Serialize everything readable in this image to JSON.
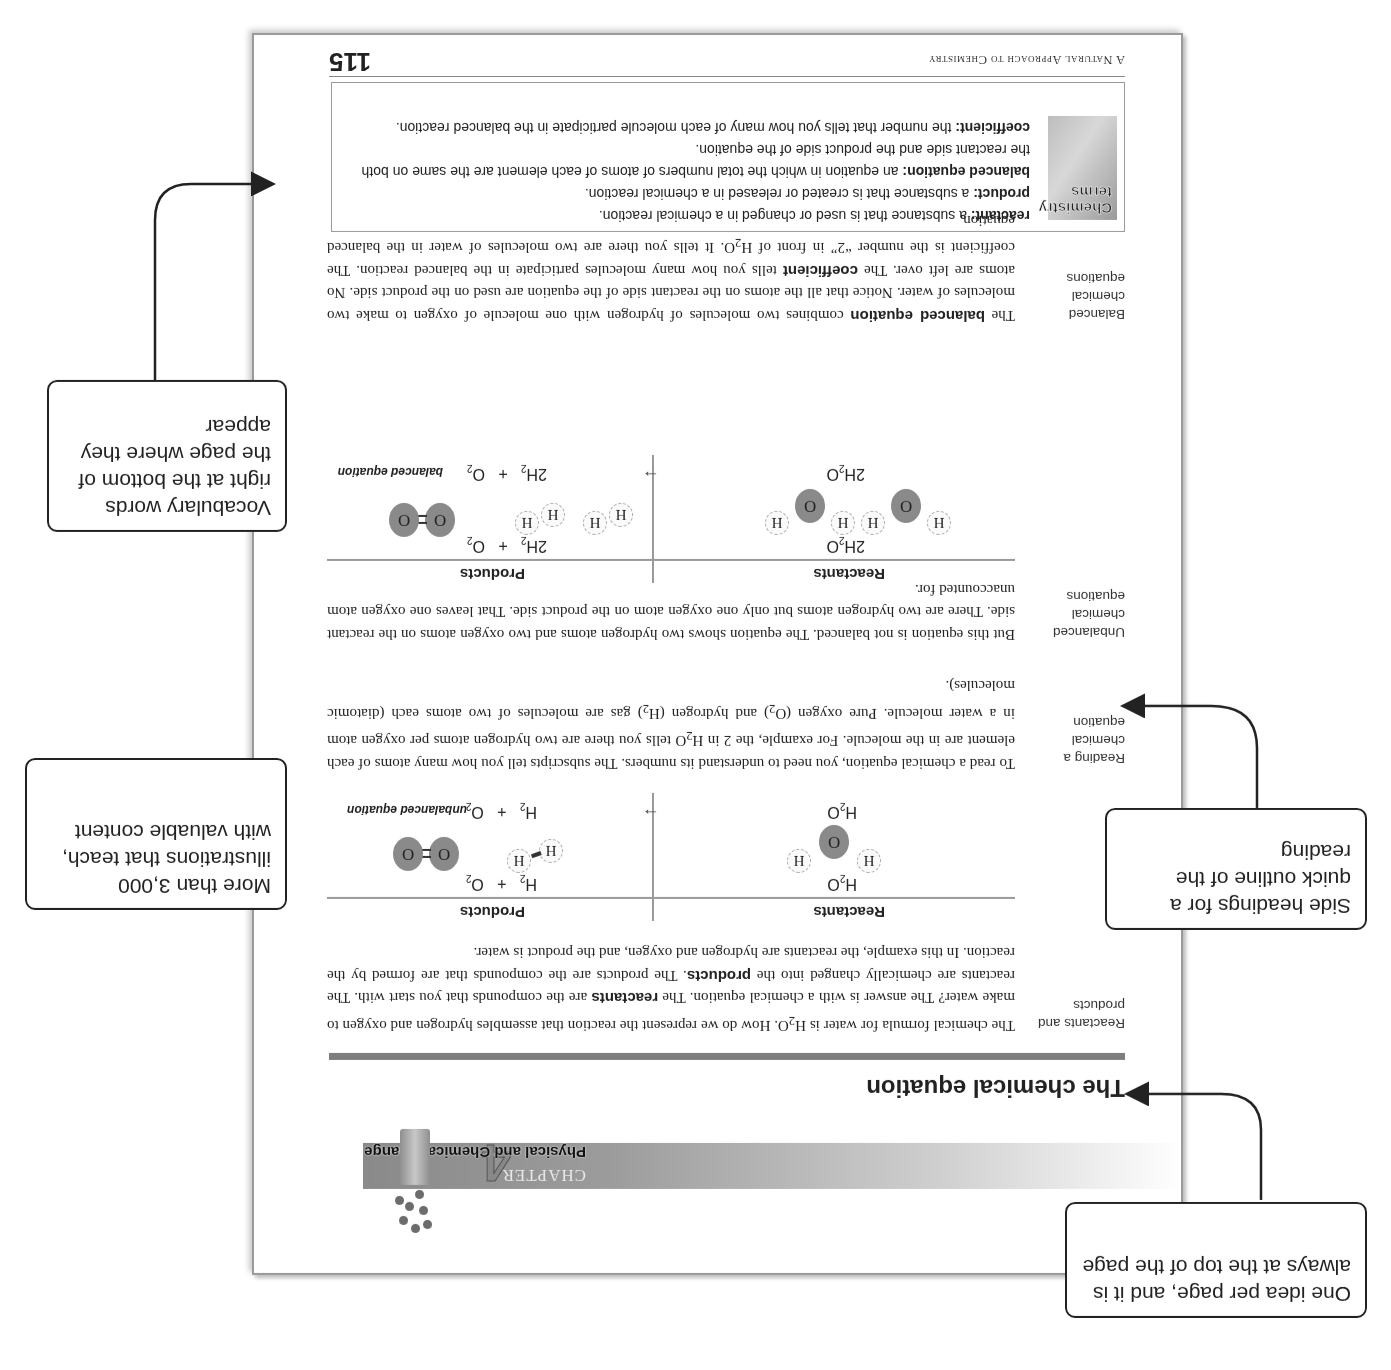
{
  "chapter": {
    "word": "CHAPTER",
    "number": "4",
    "title": "Physical and Chemical Change"
  },
  "page_title": "The chemical equation",
  "sections": [
    {
      "side_heading": "Reactants and products",
      "paragraph_html": "The chemical formula for water is H<sub>2</sub>O. How do we represent the reaction that assembles hydrogen and oxygen to make water? The answer is with a chemical equation. The <b>reactants</b> are the compounds that you start with. The reactants are chemically changed into the <b>products</b>. The products are the compounds that are formed by the reaction. In this example, the reactants are hydrogen and oxygen, and the product is water."
    },
    {
      "side_heading": "Reading a chemical equation",
      "paragraph_html": "To read a chemical equation, you need to understand its numbers. The subscripts tell you how many atoms of each element are in the molecule. For example, the 2 in H<sub>2</sub>O tells you there are two hydrogen atoms per oxygen atom in a water molecule. Pure oxygen (O<sub>2</sub>) and hydrogen (H<sub>2</sub>) gas are molecules of two atoms each (diatomic molecules)."
    },
    {
      "side_heading": "Unbalanced chemical equations",
      "paragraph_html": "But this equation is not balanced. The equation shows two hydrogen atoms and two oxygen atoms on the reactant side. There are two hydrogen atoms but only one oxygen atom on the product side. That leaves one oxygen atom unaccounted for."
    },
    {
      "side_heading": "Balanced chemical equations",
      "paragraph_html": "The <b>balanced equation</b> combines two molecules of hydrogen with one molecule of oxygen to make two molecules of water. Notice that all the atoms on the reactant side of the equation are used on the product side. No atoms are left over. The <b>coefficient</b> tells you how many molecules participate in the balanced reaction. The coefficient is the number “2” in front of H<sub>2</sub>O. It tells you there are two molecules of water in the balanced equation."
    }
  ],
  "diagrams": {
    "unbalanced": {
      "reactants_header": "Reactants",
      "products_header": "Products",
      "reactant_formula_html": "H<sub>2</sub>O",
      "product_formula_html": "H<sub>2</sub> &nbsp;&nbsp;+&nbsp;&nbsp; O<sub>2</sub>",
      "equation_html": "H<sub>2</sub>O &nbsp;&nbsp;&nbsp;&nbsp;&nbsp;&nbsp;&nbsp;&nbsp;&nbsp;&nbsp;&nbsp;&nbsp;&nbsp;&nbsp;&nbsp;&nbsp;&nbsp;&nbsp;&nbsp;&nbsp;&nbsp;&nbsp;&nbsp;",
      "arrow": "→",
      "rhs_html": "H<sub>2</sub> &nbsp;&nbsp;+&nbsp;&nbsp; O<sub>2</sub>",
      "label": "unbalanced equation",
      "atom_O": "O",
      "atom_H": "H"
    },
    "balanced": {
      "reactants_header": "Reactants",
      "products_header": "Products",
      "reactant_formula_html": "2H<sub>2</sub>O",
      "product_formula_html": "2H<sub>2</sub> &nbsp;&nbsp;+&nbsp;&nbsp; O<sub>2</sub>",
      "equation_html": "2H<sub>2</sub>O",
      "arrow": "→",
      "rhs_html": "2H<sub>2</sub> &nbsp;&nbsp;+&nbsp;&nbsp; O<sub>2</sub>",
      "label": "balanced equation",
      "atom_O": "O",
      "atom_H": "H"
    }
  },
  "vocabulary": {
    "box_label": "Chemistry terms",
    "box_label_line1": "Chemistry",
    "box_label_line2": "terms",
    "terms": [
      {
        "term": "reactant:",
        "definition": " a substance that is used or changed in a chemical reaction."
      },
      {
        "term": "product:",
        "definition": " a substance that is created or released in a chemical reaction."
      },
      {
        "term": "balanced equation:",
        "definition": " an equation in which the total numbers of atoms of each element are the same on both the reactant side and the product side of the equation."
      },
      {
        "term": "coefficient:",
        "definition": " the number that tells you how many of each molecule participate in the balanced reaction."
      }
    ]
  },
  "footer": {
    "book_title": "A Natural Approach to Chemistry",
    "page_number": "115"
  },
  "callouts": {
    "one_idea": "One idea per page, and it is always at the top of the page",
    "side_headings": "Side headings for a quick outline of the reading",
    "illustrations": "More than 3,000 illustrations that teach, with valuable content",
    "vocabulary": "Vocabulary words right at the bottom of the page where they appear"
  },
  "colors": {
    "page_border": "#9a9a9a",
    "band_dark": "#8a8a8a",
    "oxygen_atom": "#8a8a8a",
    "callout_border": "#222222"
  }
}
